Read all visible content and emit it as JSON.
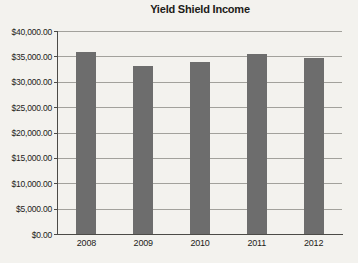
{
  "chart_data": {
    "type": "bar",
    "title": "Yield Shield Income",
    "categories": [
      "2008",
      "2009",
      "2010",
      "2011",
      "2012"
    ],
    "values": [
      35900,
      33100,
      33900,
      35400,
      34700
    ],
    "xlabel": "",
    "ylabel": "",
    "ylim": [
      0,
      40000
    ],
    "ytick_step": 5000,
    "ytick_labels": [
      "$0.00",
      "$5,000.00",
      "$10,000.00",
      "$15,000.00",
      "$20,000.00",
      "$25,000.00",
      "$30,000.00",
      "$35,000.00",
      "$40,000.00"
    ],
    "grid": true,
    "legend": false
  },
  "colors": {
    "background": "#f3f2ee",
    "bar": "#6d6d6d",
    "gridline": "#a2a19c",
    "axis": "#4c4b47",
    "text": "#1d1c19"
  }
}
